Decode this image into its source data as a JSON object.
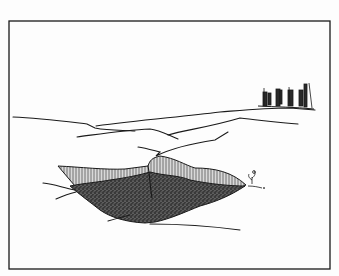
{
  "illustration": {
    "style": "black-and-white pen-and-ink drawing",
    "subject": "sunken pit in a flat landscape with a group of distant figures on the horizon",
    "colors": {
      "paper": "#fdfdfd",
      "ink": "#1a1a1a",
      "stipple_dark": "#2b2b2b",
      "hatch": "#555555"
    },
    "elements": [
      "frame-border",
      "horizon-ridge-lines",
      "distant-figures-group",
      "pit-hatched-walls",
      "pit-stippled-floor",
      "small-plant"
    ]
  }
}
